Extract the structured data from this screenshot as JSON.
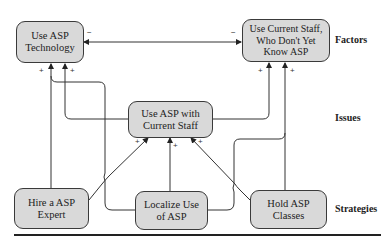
{
  "diagram": {
    "nodes": {
      "use_asp_technology": {
        "line1": "Use ASP",
        "line2": "Technology"
      },
      "use_current_staff": {
        "line1": "Use Current Staff,",
        "line2": "Who Don't Yet",
        "line3": "Know ASP"
      },
      "use_asp_with_current_staff": {
        "line1": "Use ASP with",
        "line2": "Current Staff"
      },
      "hire_asp_expert": {
        "line1": "Hire a ASP",
        "line2": "Expert"
      },
      "localize_use_of_asp": {
        "line1": "Localize Use",
        "line2": "of ASP"
      },
      "hold_asp_classes": {
        "line1": "Hold ASP",
        "line2": "Classes"
      }
    },
    "tiers": {
      "factors": "Factors",
      "issues": "Issues",
      "strategies": "Strategies"
    },
    "signs": {
      "minus": "−",
      "plus": "+"
    },
    "edges": [
      {
        "from": "use_asp_technology",
        "to": "use_current_staff",
        "type": "bidirectional",
        "polarity": "-"
      },
      {
        "from": "hire_asp_expert",
        "to": "use_asp_technology",
        "polarity": "+"
      },
      {
        "from": "use_asp_with_current_staff",
        "to": "use_asp_technology",
        "polarity": "+"
      },
      {
        "from": "use_asp_with_current_staff",
        "to": "use_current_staff",
        "polarity": "+"
      },
      {
        "from": "hold_asp_classes",
        "to": "use_current_staff",
        "polarity": "+"
      },
      {
        "from": "hire_asp_expert",
        "to": "use_asp_with_current_staff",
        "polarity": "+"
      },
      {
        "from": "localize_use_of_asp",
        "to": "use_asp_with_current_staff",
        "polarity": "+"
      },
      {
        "from": "hold_asp_classes",
        "to": "use_asp_with_current_staff",
        "polarity": "+"
      },
      {
        "from": "localize_use_of_asp",
        "to": "use_asp_technology",
        "polarity": "+"
      },
      {
        "from": "localize_use_of_asp",
        "to": "use_current_staff",
        "polarity": "+"
      }
    ],
    "colors": {
      "node_fill": "#d9d9d9",
      "node_border": "#3a3a3a",
      "edge": "#333333"
    }
  }
}
